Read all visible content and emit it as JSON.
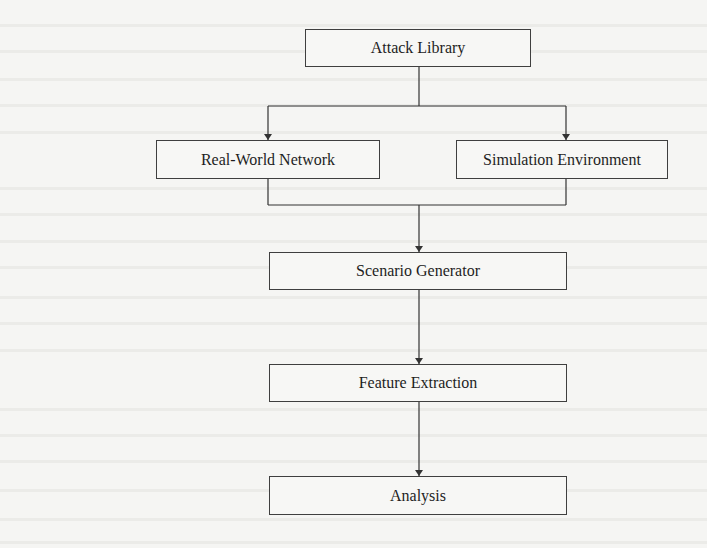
{
  "diagram": {
    "type": "flowchart",
    "nodes": [
      {
        "id": "attack_library",
        "label": "Attack Library"
      },
      {
        "id": "real_world_network",
        "label": "Real-World Network"
      },
      {
        "id": "simulation_environment",
        "label": "Simulation Environment"
      },
      {
        "id": "scenario_generator",
        "label": "Scenario Generator"
      },
      {
        "id": "feature_extraction",
        "label": "Feature Extraction"
      },
      {
        "id": "analysis",
        "label": "Analysis"
      }
    ],
    "edges": [
      {
        "from": "attack_library",
        "to": "real_world_network"
      },
      {
        "from": "attack_library",
        "to": "simulation_environment"
      },
      {
        "from": "real_world_network",
        "to": "scenario_generator"
      },
      {
        "from": "simulation_environment",
        "to": "scenario_generator"
      },
      {
        "from": "scenario_generator",
        "to": "feature_extraction"
      },
      {
        "from": "feature_extraction",
        "to": "analysis"
      }
    ]
  },
  "colors": {
    "background": "#f5f5f3",
    "line": "#333333",
    "box_border": "#3f3f3f",
    "text": "#1e1e1e"
  }
}
